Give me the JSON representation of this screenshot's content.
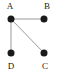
{
  "figure": {
    "kind": "undirected-graph-diagram",
    "width": 59,
    "height": 71,
    "background_color": "#ffffff",
    "node_color": "#1a1a1a",
    "edge_color": "#9a9a9a",
    "label_color": "#1a1a1a",
    "node_radius": 3.5,
    "edge_width": 1
  },
  "nodes": [
    {
      "id": "A",
      "label": "A",
      "x": 11,
      "y": 19,
      "label_x": 10,
      "label_y": 6,
      "label_anchor": "above-left"
    },
    {
      "id": "B",
      "label": "B",
      "x": 44,
      "y": 19,
      "label_x": 47,
      "label_y": 6,
      "label_anchor": "above-right"
    },
    {
      "id": "C",
      "label": "C",
      "x": 44,
      "y": 53,
      "label_x": 45,
      "label_y": 66,
      "label_anchor": "below-right"
    },
    {
      "id": "D",
      "label": "D",
      "x": 11,
      "y": 53,
      "label_x": 11,
      "label_y": 66,
      "label_anchor": "below-left"
    }
  ],
  "edges": [
    {
      "id": "A-B",
      "from": "A",
      "to": "B",
      "x1": 11,
      "y1": 19,
      "x2": 44,
      "y2": 19
    },
    {
      "id": "A-D",
      "from": "A",
      "to": "D",
      "x1": 11,
      "y1": 19,
      "x2": 11,
      "y2": 53
    },
    {
      "id": "A-C",
      "from": "A",
      "to": "C",
      "x1": 11,
      "y1": 19,
      "x2": 44,
      "y2": 53
    }
  ]
}
